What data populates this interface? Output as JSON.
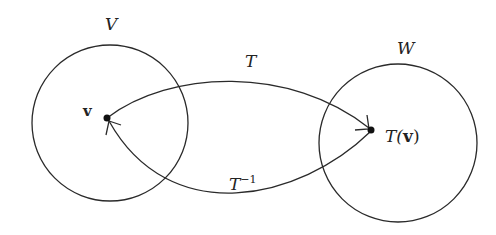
{
  "diagram": {
    "domain_set": {
      "label": "V"
    },
    "codomain_set": {
      "label": "W"
    },
    "vector": {
      "label": "v"
    },
    "image": {
      "prefix": "T(",
      "vec": "v",
      "suffix": ")"
    },
    "forward_map": {
      "label": "T"
    },
    "inverse_map": {
      "base": "T",
      "exponent": "−1"
    },
    "colors": {
      "stroke": "#2a2a2a",
      "background": "#ffffff"
    }
  }
}
